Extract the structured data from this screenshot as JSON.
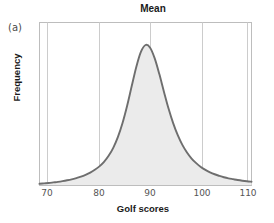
{
  "figure": {
    "panel_label": "(a)",
    "title": "Mean"
  },
  "axes": {
    "xlabel": "Golf scores",
    "ylabel": "Frequency",
    "xticks": [
      "70",
      "80",
      "90",
      "100",
      "110"
    ]
  },
  "colors": {
    "curve": "#6e6e6e",
    "fill": "#ebebeb",
    "grid": "#c9c9c9",
    "frame": "#b8b8b8",
    "text": "#1a1a1a",
    "tick_text": "#555555"
  },
  "chart_data": {
    "type": "area",
    "title": "Mean",
    "xlabel": "Golf scores",
    "ylabel": "Frequency",
    "xlim": [
      67,
      113
    ],
    "ylim": [
      0,
      1
    ],
    "grid": true,
    "legend": null,
    "annotations": [
      {
        "text": "Mean",
        "x": 90,
        "note": "title marks the mean at the vertical gridline x=90"
      },
      {
        "text": "(a)",
        "note": "panel label, top-left"
      }
    ],
    "xticks": [
      70,
      80,
      90,
      100,
      110
    ],
    "distribution": {
      "shape": "symmetric-heavy-tailed",
      "mean": 90,
      "median": 90,
      "mode": 90,
      "peak_value": 1.0
    },
    "x": [
      67,
      68,
      69,
      70,
      71,
      72,
      73,
      74,
      75,
      76,
      77,
      78,
      79,
      80,
      81,
      82,
      83,
      84,
      85,
      86,
      87,
      88,
      89,
      90,
      91,
      92,
      93,
      94,
      95,
      96,
      97,
      98,
      99,
      100,
      101,
      102,
      103,
      104,
      105,
      106,
      107,
      108,
      109,
      110,
      111,
      112,
      113
    ],
    "y": [
      0.012,
      0.015,
      0.018,
      0.022,
      0.026,
      0.031,
      0.037,
      0.044,
      0.053,
      0.063,
      0.076,
      0.092,
      0.112,
      0.136,
      0.168,
      0.211,
      0.268,
      0.344,
      0.443,
      0.566,
      0.706,
      0.844,
      0.951,
      1.0,
      0.981,
      0.905,
      0.793,
      0.668,
      0.548,
      0.444,
      0.358,
      0.289,
      0.235,
      0.192,
      0.159,
      0.132,
      0.111,
      0.094,
      0.08,
      0.069,
      0.059,
      0.051,
      0.045,
      0.039,
      0.034,
      0.03,
      0.027
    ]
  }
}
